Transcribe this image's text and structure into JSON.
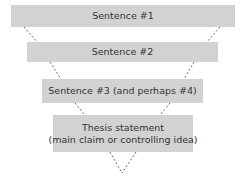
{
  "diagram": {
    "type": "inverted-funnel",
    "colors": {
      "box_fill": "#d2d2d2",
      "text": "#333333",
      "line": "#444444",
      "background": "#ffffff"
    },
    "levels": [
      {
        "lines": [
          "Sentence #1"
        ]
      },
      {
        "lines": [
          "Sentence #2"
        ]
      },
      {
        "lines": [
          "Sentence #3 (and perhaps #4)"
        ]
      },
      {
        "lines": [
          "Thesis statement",
          "(main claim or controlling idea)"
        ]
      }
    ]
  }
}
